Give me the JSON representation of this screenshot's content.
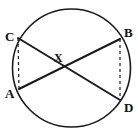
{
  "figure": {
    "type": "circle-with-intersecting-chords",
    "width": 138,
    "height": 134,
    "background_color": "#ffffff",
    "stroke_color": "#1a1a1a",
    "circle": {
      "center_x": 71.5,
      "center_y": 68,
      "radius": 59,
      "stroke_width": 1.6,
      "style": "solid"
    },
    "points": {
      "A": {
        "x": 19,
        "y": 89,
        "label": "A",
        "label_x": 5,
        "label_y": 87
      },
      "B": {
        "x": 120,
        "y": 39,
        "label": "B",
        "label_x": 124,
        "label_y": 26
      },
      "C": {
        "x": 18,
        "y": 38,
        "label": "C",
        "label_x": 5,
        "label_y": 30
      },
      "D": {
        "x": 120,
        "y": 100,
        "label": "D",
        "label_x": 124,
        "label_y": 101
      },
      "X": {
        "x": 58,
        "y": 67,
        "label": "X",
        "label_x": 54,
        "label_y": 52
      }
    },
    "chords": [
      {
        "name": "chord-CD",
        "from": "C",
        "to": "D",
        "style": "solid",
        "stroke_width": 2
      },
      {
        "name": "chord-AB",
        "from": "A",
        "to": "B",
        "style": "solid",
        "stroke_width": 2
      }
    ],
    "dashed_segments": [
      {
        "name": "segment-CA",
        "from": "C",
        "to": "A",
        "style": "dashed",
        "stroke_width": 1.2,
        "dash_pattern": "3,3"
      },
      {
        "name": "segment-BD",
        "from": "B",
        "to": "D",
        "style": "dashed",
        "stroke_width": 1.2,
        "dash_pattern": "3,3"
      }
    ],
    "labels": [
      "C",
      "B",
      "X",
      "A",
      "D"
    ]
  }
}
